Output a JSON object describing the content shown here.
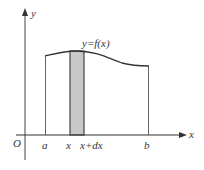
{
  "diagram": {
    "axes": {
      "x_label": "x",
      "y_label": "y",
      "origin_label": "O"
    },
    "curve_label": "y=f(x)",
    "ticks": [
      {
        "label": "a"
      },
      {
        "label": "x"
      },
      {
        "label": "x+dx"
      },
      {
        "label": "b"
      }
    ],
    "colors": {
      "line": "#333333",
      "strip_fill": "#c8c8c8",
      "boundary": "#555555"
    }
  }
}
